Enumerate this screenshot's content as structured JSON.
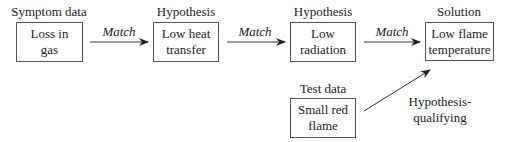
{
  "diagram": {
    "nodes": [
      {
        "id": "symptom",
        "category": "Symptom data",
        "line1": "Loss in",
        "line2": "gas"
      },
      {
        "id": "hyp1",
        "category": "Hypothesis",
        "line1": "Low heat",
        "line2": "transfer"
      },
      {
        "id": "hyp2",
        "category": "Hypothesis",
        "line1": "Low",
        "line2": "radiation"
      },
      {
        "id": "solution",
        "category": "Solution",
        "line1": "Low flame",
        "line2": "temperature"
      },
      {
        "id": "test",
        "category": "Test data",
        "line1": "Small red",
        "line2": "flame"
      }
    ],
    "edges": [
      {
        "from": "symptom",
        "to": "hyp1",
        "label": "Match"
      },
      {
        "from": "hyp1",
        "to": "hyp2",
        "label": "Match"
      },
      {
        "from": "hyp2",
        "to": "solution",
        "label": "Match"
      },
      {
        "from": "test",
        "to": "solution",
        "label_line1": "Hypothesis-",
        "label_line2": "qualifying"
      }
    ]
  }
}
